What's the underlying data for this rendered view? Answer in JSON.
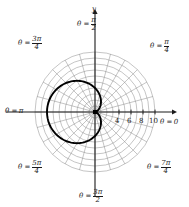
{
  "figure": {
    "width": 189,
    "height": 207,
    "background": "#ffffff",
    "ink_color": "#1a1a1a",
    "grid_color": "#8a8a8a",
    "curve_color": "#000000"
  },
  "axes": {
    "y_axis_label": "y",
    "x_axis_angle_label": {
      "lhs": "θ =",
      "value": "0"
    },
    "x_tick_labels": [
      "4",
      "6",
      "8",
      "10"
    ],
    "x_tick_values": [
      4,
      6,
      8,
      10
    ]
  },
  "angle_labels": [
    {
      "name": "theta-pi-over-2",
      "lhs": "θ =",
      "numerator": "π",
      "denominator": "2",
      "degrees": 90
    },
    {
      "name": "theta-pi-over-4",
      "lhs": "θ =",
      "numerator": "π",
      "denominator": "4",
      "degrees": 45
    },
    {
      "name": "theta-3pi-over-4",
      "lhs": "θ =",
      "numerator": "3π",
      "denominator": "4",
      "degrees": 135
    },
    {
      "name": "theta-pi",
      "lhs": "θ =",
      "numerator": "π",
      "denominator": "",
      "degrees": 180
    },
    {
      "name": "theta-5pi-over-4",
      "lhs": "θ =",
      "numerator": "5π",
      "denominator": "4",
      "degrees": 225
    },
    {
      "name": "theta-3pi-over-2",
      "lhs": "θ =",
      "numerator": "3π",
      "denominator": "2",
      "degrees": 270
    },
    {
      "name": "theta-7pi-over-4",
      "lhs": "θ =",
      "numerator": "7π",
      "denominator": "4",
      "degrees": 315
    }
  ],
  "chart_data": {
    "type": "line",
    "coordinate_system": "polar",
    "title": "",
    "xlabel": "",
    "ylabel": "",
    "origin_px": {
      "x": 95,
      "y": 112
    },
    "pixels_per_unit": 6.0,
    "grid": {
      "on": true,
      "radial_circles": [
        1,
        2,
        3,
        4,
        5,
        6,
        7,
        8,
        9,
        10
      ],
      "labeled_circles": [
        4,
        6,
        8,
        10
      ],
      "max_radius": 10,
      "spoke_angle_step_deg": 15,
      "spoke_count": 24
    },
    "legend": {
      "entries": [],
      "position": "none"
    },
    "series": [
      {
        "name": "cardioid",
        "equation": "r = 4(1 - cos θ)",
        "a": 4,
        "theta_deg": [
          0,
          15,
          30,
          45,
          60,
          75,
          90,
          105,
          120,
          135,
          150,
          165,
          180,
          195,
          210,
          225,
          240,
          255,
          270,
          285,
          300,
          315,
          330,
          345,
          360
        ],
        "r": [
          0.0,
          0.14,
          0.54,
          1.17,
          2.0,
          2.96,
          4.0,
          5.04,
          6.0,
          6.83,
          7.46,
          7.86,
          8.0,
          7.86,
          7.46,
          6.83,
          6.0,
          5.04,
          4.0,
          2.96,
          2.0,
          1.17,
          0.54,
          0.14,
          0.0
        ]
      }
    ],
    "annotations": [
      {
        "text": "pole at origin",
        "visible": false
      }
    ]
  }
}
